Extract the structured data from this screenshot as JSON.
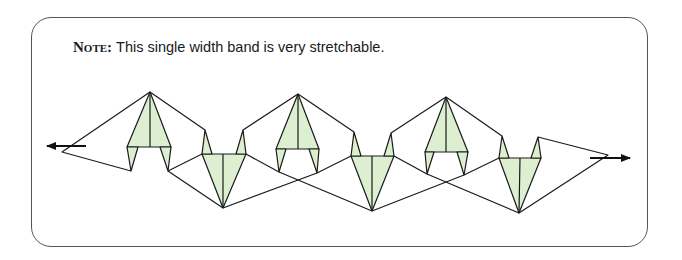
{
  "note": {
    "label": "Note:",
    "text": "This single width band is very stretchable."
  },
  "diagram": {
    "colors": {
      "fill": "#dcefd0",
      "stroke": "#1a1a1a",
      "frame": "#555555"
    },
    "arrows": [
      {
        "direction": "left"
      },
      {
        "direction": "right"
      }
    ],
    "units": [
      {
        "type": "upright",
        "apex": [
          150,
          92
        ]
      },
      {
        "type": "inverted",
        "tip": [
          223,
          208
        ]
      },
      {
        "type": "upright",
        "apex": [
          298,
          94
        ]
      },
      {
        "type": "inverted",
        "tip": [
          372,
          211
        ]
      },
      {
        "type": "upright",
        "apex": [
          446,
          97
        ]
      },
      {
        "type": "inverted",
        "tip": [
          519,
          213
        ]
      }
    ]
  }
}
